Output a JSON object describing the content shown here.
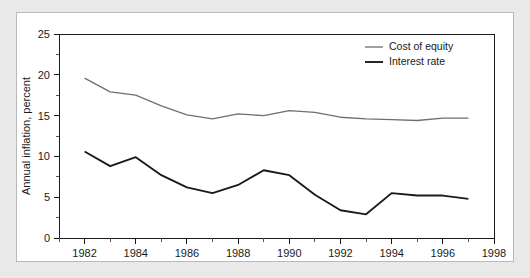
{
  "figure": {
    "background_color": "#e9e9e9",
    "card_color": "#ffffff",
    "border_color": "#b9b9b9"
  },
  "chart_data": {
    "type": "line",
    "title": "",
    "xlabel": "",
    "ylabel": "Annual inflation, percent",
    "xlim": [
      1981,
      1998
    ],
    "ylim": [
      0,
      25
    ],
    "grid": false,
    "legend_position": "top-right",
    "x_ticks_major": [
      1982,
      1984,
      1986,
      1988,
      1990,
      1992,
      1994,
      1996,
      1998
    ],
    "x_tick_labels": [
      "1982",
      "1984",
      "1986",
      "1988",
      "1990",
      "1992",
      "1994",
      "1996",
      "1998"
    ],
    "x_ticks_minor": [
      1981,
      1983,
      1985,
      1987,
      1989,
      1991,
      1993,
      1995,
      1997
    ],
    "y_ticks_major": [
      0,
      5,
      10,
      15,
      20,
      25
    ],
    "y_tick_labels": [
      "0",
      "5",
      "10",
      "15",
      "20",
      "25"
    ],
    "y_ticks_minor": [
      2.5,
      7.5,
      12.5,
      17.5,
      22.5
    ],
    "x": [
      1982,
      1983,
      1984,
      1985,
      1986,
      1987,
      1988,
      1989,
      1990,
      1991,
      1992,
      1993,
      1994,
      1995,
      1996,
      1997
    ],
    "series": [
      {
        "name": "Cost of equity",
        "color": "#6f6f6f",
        "stroke_width": 1.3,
        "values": [
          19.6,
          17.9,
          17.5,
          16.2,
          15.1,
          14.6,
          15.2,
          15.0,
          15.6,
          15.4,
          14.8,
          14.6,
          14.5,
          14.4,
          14.7,
          14.7
        ]
      },
      {
        "name": "Interest rate",
        "color": "#1a1a1a",
        "stroke_width": 1.9,
        "values": [
          10.6,
          8.8,
          9.9,
          7.7,
          6.2,
          5.5,
          6.5,
          8.3,
          7.7,
          5.3,
          3.4,
          2.9,
          5.5,
          5.2,
          5.2,
          4.8
        ]
      }
    ]
  }
}
